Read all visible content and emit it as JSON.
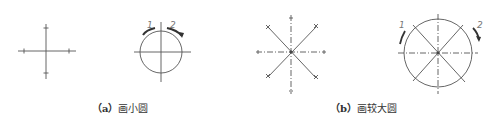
{
  "diagram": {
    "panels": [
      {
        "id": "a",
        "caption_prefix": "（a）",
        "caption_text": "画小圆",
        "figures": [
          {
            "name": "centerline-cross",
            "center": [
              46,
              51
            ]
          },
          {
            "name": "small-circle",
            "center": [
              161,
              52
            ],
            "radius": 21,
            "arc_labels": [
              "1",
              "2"
            ]
          }
        ]
      },
      {
        "id": "b",
        "caption_prefix": "（b）",
        "caption_text": "画较大圆",
        "figures": [
          {
            "name": "radial-lines-star",
            "center": [
              291,
              52
            ]
          },
          {
            "name": "large-circle",
            "center": [
              438,
              53
            ],
            "radius": 34,
            "arc_labels": [
              "1",
              "2"
            ]
          }
        ]
      }
    ]
  },
  "colors": {
    "line": "#555555",
    "arrow": "#444444",
    "label": "#777777"
  }
}
